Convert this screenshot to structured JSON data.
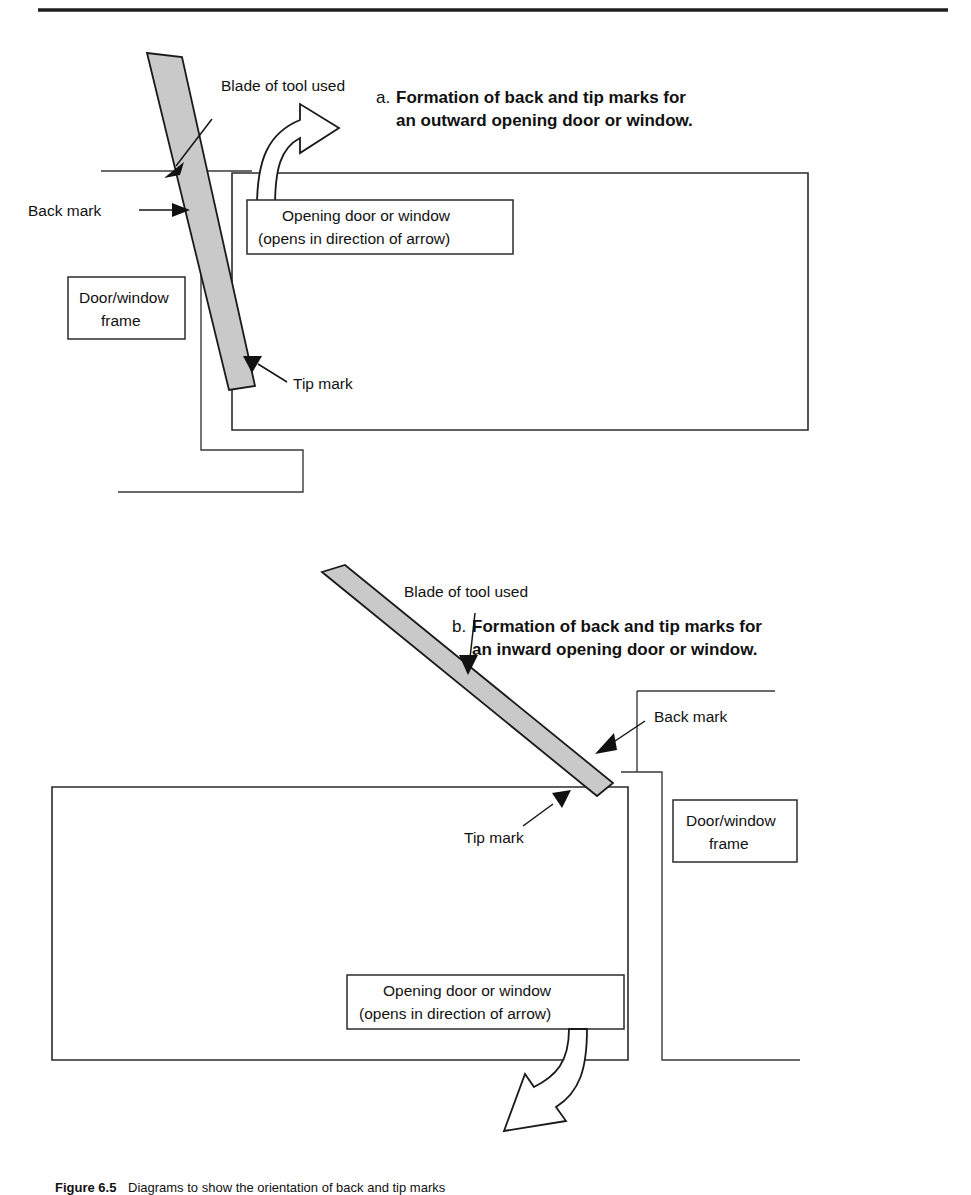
{
  "figure": {
    "domain_note": "forensic tool-mark diagram",
    "top_rule": true
  },
  "panel_a": {
    "heading_prefix": "a.",
    "heading_line1": "Formation of back and tip marks for",
    "heading_line2": "an outward opening door or window.",
    "labels": {
      "blade": "Blade of tool used",
      "back_mark": "Back mark",
      "tip_mark": "Tip mark",
      "frame_line1": "Door/window",
      "frame_line2": "frame",
      "opening_line1": "Opening door or window",
      "opening_line2": "(opens in direction of arrow)"
    }
  },
  "panel_b": {
    "heading_prefix": "b.",
    "heading_line1": "Formation of back and tip marks for",
    "heading_line2": "an inward opening door or window.",
    "labels": {
      "blade": "Blade of tool used",
      "back_mark": "Back mark",
      "tip_mark": "Tip mark",
      "frame_line1": "Door/window",
      "frame_line2": "frame",
      "opening_line1": "Opening door or window",
      "opening_line2": "(opens in direction of arrow)"
    }
  },
  "caption": {
    "bold_prefix": "Figure 6.5",
    "text": "Diagrams to show the orientation of back and tip marks"
  },
  "colors": {
    "blade_fill": "#c9c9c9",
    "line": "#2b2b2b",
    "text": "#111111",
    "background": "#ffffff"
  }
}
